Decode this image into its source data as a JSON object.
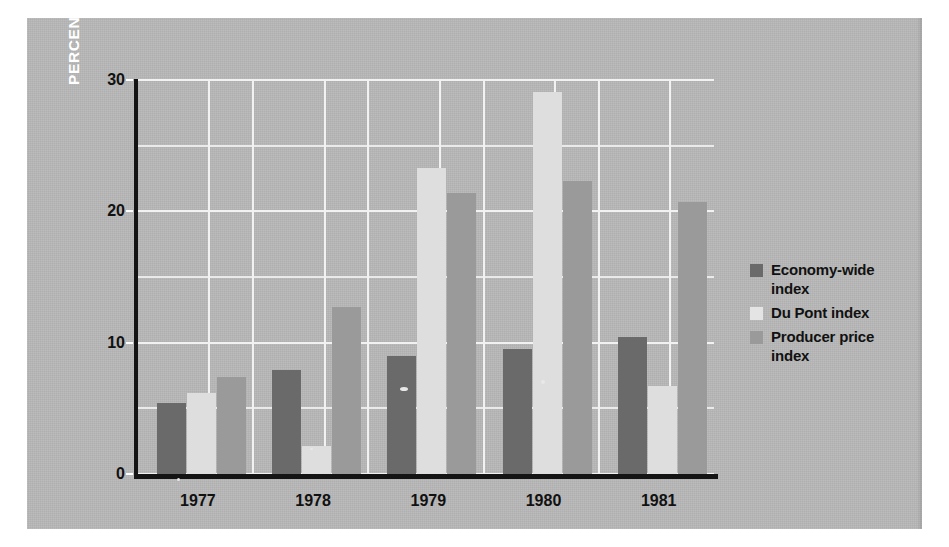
{
  "chart_data": {
    "type": "bar",
    "title": "",
    "xlabel": "",
    "ylabel": "PERCENT CHANGE",
    "categories": [
      "1977",
      "1978",
      "1979",
      "1980",
      "1981"
    ],
    "series": [
      {
        "name": "Economy-wide index",
        "color": "#6a6a6a",
        "values": [
          5.4,
          7.9,
          9.0,
          9.5,
          10.4
        ]
      },
      {
        "name": "Du Pont index",
        "color": "#dedede",
        "values": [
          6.2,
          2.1,
          23.3,
          29.1,
          6.7
        ]
      },
      {
        "name": "Producer price index",
        "color": "#9a9a9a",
        "values": [
          7.4,
          12.7,
          21.4,
          22.3,
          20.7
        ]
      }
    ],
    "ylim": [
      0,
      30
    ],
    "yticks": [
      0,
      10,
      20,
      30
    ],
    "ytick_labels": [
      "0",
      "10",
      "20",
      "30"
    ],
    "yminor_ticks": [
      5,
      15,
      25
    ],
    "grid": true,
    "legend_position": "right"
  },
  "axis": {
    "y_title": "PERCENT CHANGE",
    "ticks": [
      {
        "label": "30",
        "value": 30
      },
      {
        "label": "20",
        "value": 20
      },
      {
        "label": "10",
        "value": 10
      },
      {
        "label": "0",
        "value": 0
      }
    ]
  },
  "xlabels": [
    "1977",
    "1978",
    "1979",
    "1980",
    "1981"
  ],
  "legend": {
    "items": [
      {
        "label": "Economy-wide index",
        "swatch": "s0"
      },
      {
        "label": "Du Pont index",
        "swatch": "s1"
      },
      {
        "label": "Producer price index",
        "swatch": "s2"
      }
    ]
  },
  "colors": {
    "plate_background": "#b6b6b6",
    "axis": "#141414",
    "gridline": "#f2f2f2",
    "series_1": "#6a6a6a",
    "series_2": "#dedede",
    "series_3": "#9a9a9a",
    "text": "#111111",
    "y_title_text": "#ffffff"
  }
}
